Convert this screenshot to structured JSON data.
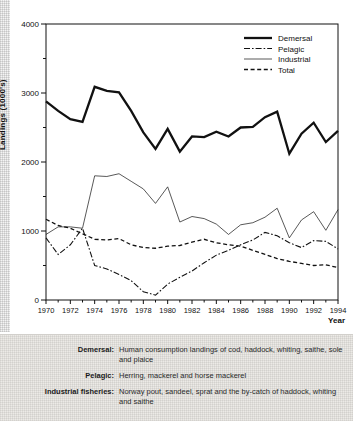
{
  "chart_data": {
    "type": "line",
    "title": "",
    "xlabel": "Year",
    "ylabel": "Landings (1000's)",
    "xlim": [
      1970,
      1994
    ],
    "ylim": [
      0,
      4000
    ],
    "ytick_major": [
      0,
      1000,
      2000,
      3000,
      4000
    ],
    "ytick_minor": [
      500,
      1500,
      2500,
      3500
    ],
    "xticks": [
      1970,
      1972,
      1974,
      1976,
      1978,
      1980,
      1982,
      1984,
      1986,
      1988,
      1990,
      1992,
      1994
    ],
    "grid": false,
    "legend_position": "top-right",
    "x": [
      1970,
      1971,
      1972,
      1973,
      1974,
      1975,
      1976,
      1977,
      1978,
      1979,
      1980,
      1981,
      1982,
      1983,
      1984,
      1985,
      1986,
      1987,
      1988,
      1989,
      1990,
      1991,
      1992,
      1993,
      1994
    ],
    "series": [
      {
        "name": "Demersal",
        "style": "thick-solid",
        "values": [
          2880,
          2740,
          2620,
          2580,
          3090,
          3030,
          3010,
          2740,
          2430,
          2190,
          2480,
          2150,
          2370,
          2360,
          2440,
          2370,
          2500,
          2510,
          2650,
          2730,
          2120,
          2410,
          2570,
          2290,
          2450
        ]
      },
      {
        "name": "Pelagic",
        "style": "dash-dot",
        "values": [
          900,
          660,
          800,
          1040,
          500,
          450,
          370,
          280,
          120,
          70,
          230,
          330,
          420,
          540,
          650,
          720,
          800,
          870,
          980,
          930,
          830,
          760,
          860,
          850,
          740
        ]
      },
      {
        "name": "Industrial",
        "style": "thin-solid",
        "values": [
          950,
          1060,
          1060,
          1040,
          1800,
          1790,
          1830,
          1720,
          1610,
          1400,
          1640,
          1130,
          1210,
          1180,
          1100,
          950,
          1090,
          1120,
          1200,
          1330,
          900,
          1160,
          1280,
          1010,
          1310
        ]
      },
      {
        "name": "Total",
        "style": "dashed",
        "values": [
          1170,
          1080,
          1040,
          960,
          880,
          870,
          890,
          800,
          760,
          750,
          780,
          790,
          840,
          880,
          830,
          800,
          780,
          720,
          660,
          600,
          560,
          530,
          500,
          510,
          470
        ]
      }
    ]
  },
  "legend": {
    "items": [
      {
        "label": "Demersal",
        "style": "thick-solid"
      },
      {
        "label": "Pelagic",
        "style": "dash-dot"
      },
      {
        "label": "Industrial",
        "style": "thin-solid"
      },
      {
        "label": "Total",
        "style": "dashed"
      }
    ]
  },
  "caption": {
    "rows": [
      {
        "term": "Demersal:",
        "definition": "Human consumption landings of cod, haddock, whiting, saithe, sole and plaice"
      },
      {
        "term": "Pelagic:",
        "definition": "Herring, mackerel and horse mackerel"
      },
      {
        "term": "Industrial fisheries:",
        "definition": "Norway pout, sandeel, sprat and the by-catch of haddock, whiting and saithe"
      }
    ]
  }
}
